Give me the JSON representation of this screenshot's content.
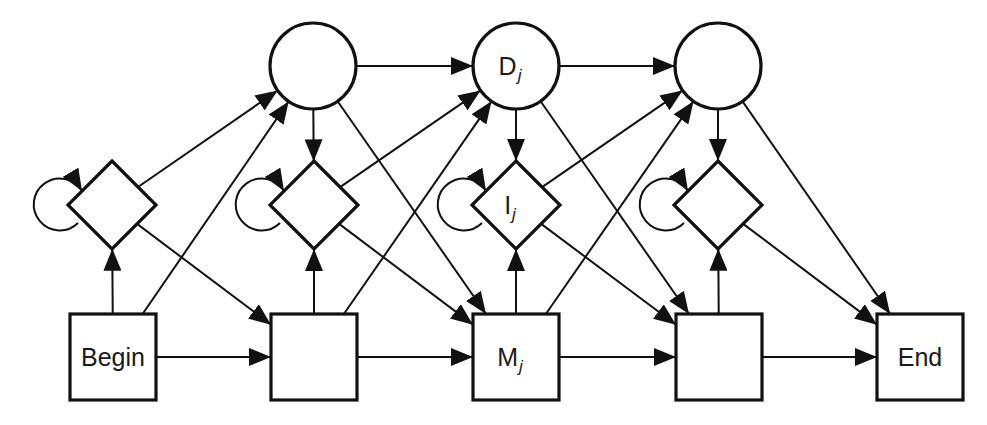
{
  "diagram": {
    "type": "profile-hmm-architecture",
    "colors": {
      "stroke": "#111111",
      "background": "#ffffff"
    },
    "nodes": {
      "delete": [
        {
          "id": "D1",
          "label": "",
          "sub": "",
          "cx": 313,
          "cy": 66
        },
        {
          "id": "Dj",
          "label": "D",
          "sub": "j",
          "cx": 516,
          "cy": 66
        },
        {
          "id": "D3",
          "label": "",
          "sub": "",
          "cx": 718,
          "cy": 66
        }
      ],
      "insert": [
        {
          "id": "I0",
          "label": "",
          "sub": "",
          "cx": 112,
          "cy": 205
        },
        {
          "id": "I1",
          "label": "",
          "sub": "",
          "cx": 314,
          "cy": 205
        },
        {
          "id": "Ij",
          "label": "I",
          "sub": "j",
          "cx": 516,
          "cy": 205
        },
        {
          "id": "I3",
          "label": "",
          "sub": "",
          "cx": 718,
          "cy": 205
        }
      ],
      "match": [
        {
          "id": "Begin",
          "label": "Begin",
          "sub": "",
          "cx": 113,
          "cy": 357
        },
        {
          "id": "M1",
          "label": "",
          "sub": "",
          "cx": 314,
          "cy": 357
        },
        {
          "id": "Mj",
          "label": "M",
          "sub": "j",
          "cx": 516,
          "cy": 357
        },
        {
          "id": "M3",
          "label": "",
          "sub": "",
          "cx": 719,
          "cy": 357
        },
        {
          "id": "End",
          "label": "End",
          "sub": "",
          "cx": 920,
          "cy": 357
        }
      ]
    },
    "edges": [
      [
        "Begin",
        "M1"
      ],
      [
        "M1",
        "Mj"
      ],
      [
        "Mj",
        "M3"
      ],
      [
        "M3",
        "End"
      ],
      [
        "Begin",
        "I0"
      ],
      [
        "M1",
        "I1"
      ],
      [
        "Mj",
        "Ij"
      ],
      [
        "M3",
        "I3"
      ],
      [
        "D1",
        "I1"
      ],
      [
        "Dj",
        "Ij"
      ],
      [
        "D3",
        "I3"
      ],
      [
        "D1",
        "Dj"
      ],
      [
        "Dj",
        "D3"
      ],
      [
        "Begin",
        "D1"
      ],
      [
        "M1",
        "Dj"
      ],
      [
        "Mj",
        "D3"
      ],
      [
        "I0",
        "D1"
      ],
      [
        "I1",
        "Dj"
      ],
      [
        "Ij",
        "D3"
      ],
      [
        "I0",
        "M1"
      ],
      [
        "I1",
        "Mj"
      ],
      [
        "Ij",
        "M3"
      ],
      [
        "I3",
        "End"
      ],
      [
        "D1",
        "Mj"
      ],
      [
        "Dj",
        "M3"
      ],
      [
        "D3",
        "End"
      ],
      [
        "I0",
        "I0"
      ],
      [
        "I1",
        "I1"
      ],
      [
        "Ij",
        "Ij"
      ],
      [
        "I3",
        "I3"
      ]
    ]
  }
}
